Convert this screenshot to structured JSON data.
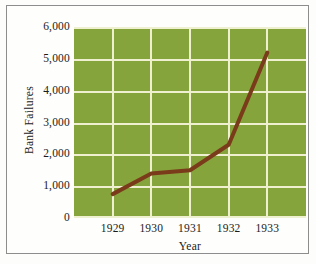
{
  "chart_data": {
    "type": "line",
    "title": "",
    "xlabel": "Year",
    "ylabel": "Bank Failures",
    "categories": [
      "1929",
      "1930",
      "1931",
      "1932",
      "1933"
    ],
    "x": [
      1929,
      1930,
      1931,
      1932,
      1933
    ],
    "values": [
      750,
      1400,
      1500,
      2300,
      5200
    ],
    "series": [
      {
        "name": "Bank Failures",
        "values": [
          750,
          1400,
          1500,
          2300,
          5200
        ]
      }
    ],
    "ylim": [
      0,
      6000
    ],
    "ytick_labels": [
      "0",
      "1,000",
      "2,000",
      "3,000",
      "4,000",
      "5,000",
      "6,000"
    ],
    "ytick_values": [
      0,
      1000,
      2000,
      3000,
      4000,
      5000,
      6000
    ],
    "xtick_labels": [
      "1929",
      "1930",
      "1931",
      "1932",
      "1933"
    ],
    "grid": true,
    "legend": "none",
    "colors": {
      "plot_background": "#86a43c",
      "gridline": "#eef0d0",
      "line": "#7a3b1a",
      "text": "#1b1b1b",
      "frame": "#8d8d8d",
      "page_background": "#fefefc"
    }
  }
}
